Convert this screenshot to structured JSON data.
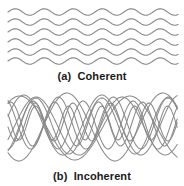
{
  "figure": {
    "background_color": "#ffffff",
    "width": 184,
    "height": 186
  },
  "style": {
    "wave_stroke_color": "#8a8a8a",
    "caption_color": "#1a1a1a"
  },
  "panels": [
    {
      "id": "coherent",
      "caption": "(a)  Coherent",
      "label_letter": "(a)",
      "label_text": "Coherent",
      "description": "six identical in-phase sine waves stacked vertically",
      "wave_count": 6
    },
    {
      "id": "incoherent",
      "caption": "(b)  Incoherent",
      "label_letter": "(b)",
      "label_text": "Incoherent",
      "description": "ten overlapping sine waves with differing amplitude, frequency and phase",
      "wave_count": 10
    }
  ],
  "chart_data": {
    "type": "line",
    "xlabel": "",
    "ylabel": "",
    "grid": false,
    "legend": "none",
    "x_range": [
      8,
      178
    ],
    "panels": [
      {
        "name": "(a) Coherent",
        "note": "identical amplitude, wavelength and phase; waves offset only vertically",
        "wavelength_px": 29,
        "amplitude_px": 3.2,
        "phase_deg": 0,
        "baselines_px": [
          12,
          22,
          32,
          42,
          52,
          61
        ],
        "series": [
          {
            "name": "wave-1",
            "baseline": 12,
            "amplitude": 3.2,
            "wavelength": 29,
            "phase": 0
          },
          {
            "name": "wave-2",
            "baseline": 22,
            "amplitude": 3.2,
            "wavelength": 29,
            "phase": 0
          },
          {
            "name": "wave-3",
            "baseline": 32,
            "amplitude": 3.2,
            "wavelength": 29,
            "phase": 0
          },
          {
            "name": "wave-4",
            "baseline": 42,
            "amplitude": 3.2,
            "wavelength": 29,
            "phase": 0
          },
          {
            "name": "wave-5",
            "baseline": 52,
            "amplitude": 3.2,
            "wavelength": 29,
            "phase": 0
          },
          {
            "name": "wave-6",
            "baseline": 61,
            "amplitude": 3.2,
            "wavelength": 29,
            "phase": 0
          }
        ]
      },
      {
        "name": "(b) Incoherent",
        "note": "random amplitudes, wavelengths and phases; waves overlap and interfere",
        "baseline_px": 42,
        "series": [
          {
            "name": "wave-1",
            "baseline": 42,
            "amplitude": 30,
            "wavelength": 78,
            "phase": 0.3
          },
          {
            "name": "wave-2",
            "baseline": 40,
            "amplitude": 26,
            "wavelength": 55,
            "phase": 2.1
          },
          {
            "name": "wave-3",
            "baseline": 44,
            "amplitude": 34,
            "wavelength": 96,
            "phase": 4.0
          },
          {
            "name": "wave-4",
            "baseline": 41,
            "amplitude": 22,
            "wavelength": 44,
            "phase": 1.2
          },
          {
            "name": "wave-5",
            "baseline": 43,
            "amplitude": 28,
            "wavelength": 66,
            "phase": 5.2
          },
          {
            "name": "wave-6",
            "baseline": 39,
            "amplitude": 19,
            "wavelength": 38,
            "phase": 3.4
          },
          {
            "name": "wave-7",
            "baseline": 45,
            "amplitude": 32,
            "wavelength": 110,
            "phase": 0.9
          },
          {
            "name": "wave-8",
            "baseline": 42,
            "amplitude": 24,
            "wavelength": 50,
            "phase": 4.7
          },
          {
            "name": "wave-9",
            "baseline": 40,
            "amplitude": 17,
            "wavelength": 33,
            "phase": 2.6
          },
          {
            "name": "wave-10",
            "baseline": 43,
            "amplitude": 29,
            "wavelength": 86,
            "phase": 5.8
          }
        ]
      }
    ]
  }
}
